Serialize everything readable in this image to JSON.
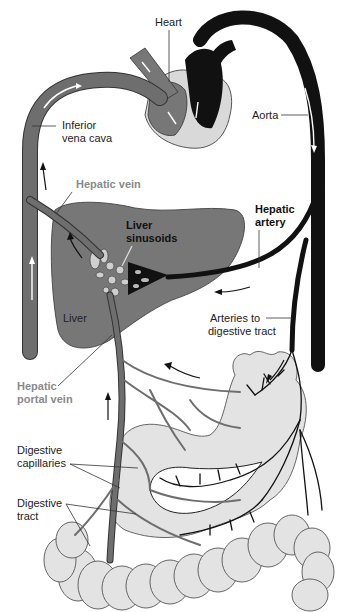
{
  "diagram": {
    "colors": {
      "vein": "#6e6e6e",
      "artery": "#111111",
      "liver": "#777777",
      "digestive_tract": "#e3e3e3",
      "heart_wall": "#d9d9d9",
      "gray_label": "#8a8a8a"
    },
    "labels": {
      "heart": "Heart",
      "aorta": "Aorta",
      "inferior_vena_cava_line1": "Inferior",
      "inferior_vena_cava_line2": "vena cava",
      "hepatic_vein": "Hepatic vein",
      "hepatic_artery_line1": "Hepatic",
      "hepatic_artery_line2": "artery",
      "liver_sinusoids_line1": "Liver",
      "liver_sinusoids_line2": "sinusoids",
      "liver": "Liver",
      "arteries_to_digestive_tract_line1": "Arteries to",
      "arteries_to_digestive_tract_line2": "digestive tract",
      "hepatic_portal_vein_line1": "Hepatic",
      "hepatic_portal_vein_line2": "portal vein",
      "digestive_capillaries_line1": "Digestive",
      "digestive_capillaries_line2": "capillaries",
      "digestive_tract_line1": "Digestive",
      "digestive_tract_line2": "tract"
    }
  }
}
